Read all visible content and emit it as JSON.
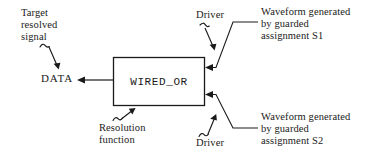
{
  "diagram": {
    "stroke_color": "#1a1a1a",
    "background_color": "#ffffff",
    "box": {
      "label": "WIRED_OR",
      "x": 113,
      "y": 57,
      "width": 92,
      "height": 49
    },
    "labels": {
      "target_resolved_signal": "Target\nresolved\nsignal",
      "data": "DATA",
      "driver_top": "Driver",
      "driver_bottom": "Driver",
      "resolution_function": "Resolution\nfunction",
      "waveform_s1": "Waveform generated\nby guarded\nassignment S1",
      "waveform_s2": "Waveform generated\nby guarded\nassignment S2"
    },
    "annotations": [
      {
        "name": "target-resolved-signal-pointer",
        "kind": "squiggle-arrow",
        "direction": "down-right",
        "from": [
          40,
          46
        ],
        "to": [
          58,
          68
        ]
      },
      {
        "name": "data-output-arrow",
        "kind": "straight-arrow",
        "direction": "left",
        "from": [
          113,
          80
        ],
        "to": [
          78,
          80
        ]
      },
      {
        "name": "driver-top-pointer",
        "kind": "squiggle-arrow",
        "direction": "down-right",
        "from": [
          200,
          26
        ],
        "to": [
          215,
          50
        ]
      },
      {
        "name": "driver-bottom-pointer",
        "kind": "squiggle-arrow",
        "direction": "up-right",
        "from": [
          200,
          136
        ],
        "to": [
          216,
          112
        ]
      },
      {
        "name": "resolution-function-pointer",
        "kind": "squiggle-arrow",
        "direction": "up-right",
        "from": [
          114,
          121
        ],
        "to": [
          133,
          108
        ]
      },
      {
        "name": "waveform-s1-leader",
        "kind": "leader-arrow",
        "direction": "left",
        "points": [
          [
            258,
            22
          ],
          [
            232,
            22
          ],
          [
            215,
            68
          ],
          [
            206,
            68
          ]
        ]
      },
      {
        "name": "waveform-s2-leader",
        "kind": "leader-arrow",
        "direction": "left",
        "points": [
          [
            258,
            128
          ],
          [
            232,
            128
          ],
          [
            215,
            94
          ],
          [
            206,
            94
          ]
        ]
      }
    ]
  }
}
